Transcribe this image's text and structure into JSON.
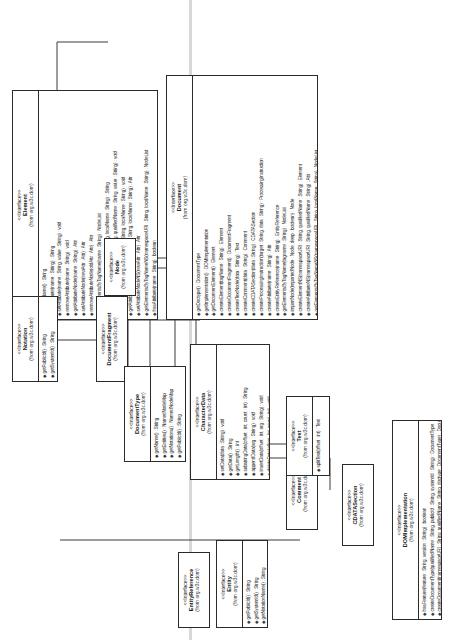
{
  "diagram": {
    "kind": "uml-class-diagram",
    "package": "(from org.w3c.dom)",
    "stereotype": "<<Interface>>",
    "rotation_degrees": -90,
    "relationship": "generalization"
  },
  "classes": {
    "attr": {
      "stereotype": "<<Interface>>",
      "name": "Attr",
      "package": "(from org.w3c.dom)",
      "operations": [
        "getName() : String",
        "getSpecified() : boolean",
        "getValue() : String",
        "setValue(value : String) : void",
        "getOwnerElement() : Element"
      ]
    },
    "processing_instruction": {
      "stereotype": "<<Interface>>",
      "name": "ProcessingInstruction",
      "package": "(from org.w3c.dom)",
      "operations": [
        "getTarget() : String",
        "setData(data : String) : void",
        "getData() : String"
      ]
    },
    "element": {
      "stereotype": "<<Interface>>",
      "name": "Element",
      "package": "(from org.w3c.dom)",
      "operations": [
        "getTagName() : String",
        "getAttribute(name : String) : String",
        "setAttribute(name : String, value : String) : void",
        "removeAttribute(name : String) : void",
        "getAttributeNode(name : String) : Attr",
        "setAttributeNode(newAttr : Attr) : Attr",
        "removeAttributeNode(oldAttr : Attr) : Attr",
        "getElementsByTagName(name : String) : NodeList",
        "getAttributeNS(namespaceURI : String, localName : String) : String",
        "setAttributeNS(namespaceURI : String, qualifiedName : String, value : String) : void",
        "removeAttributeNS(namespaceURI : String, localName : String) : void",
        "getAttributeNodeNS(namespaceURI : String, localName : String) : Attr",
        "setAttributeNodeNS(newAttr : Attr) : Attr",
        "getElementsByTagNameNS(namespaceURI : String, localName : String) : NodeList",
        "hasAttribute(name : String) : boolean",
        "hasAttributeNS(namespaceURI : String, localName : String) : boolean"
      ]
    },
    "document": {
      "stereotype": "<<Interface>>",
      "name": "Document",
      "package": "(from org.w3c.dom)",
      "operations": [
        "getDoctype() : DocumentType",
        "getImplementation() : DOMImplementation",
        "getDocumentElement() : Element",
        "createElement(tagName : String) : Element",
        "createDocumentFragment() : DocumentFragment",
        "createTextNode(data : String) : Text",
        "createComment(data : String) : Comment",
        "createCDATASection(data : String) : CDATASection",
        "createProcessingInstruction(target : String, data : String) : ProcessingInstruction",
        "createAttribute(name : String) : Attr",
        "createEntityReference(name : String) : EntityReference",
        "getElementsByTagName(tagname : String) : NodeList",
        "importNode(importedNode : Node, deep : boolean) : Node",
        "createElementNS(namespaceURI : String, qualifiedName : String) : Element",
        "createAttributeNS(namespaceURI : String, qualifiedName : String) : Attr",
        "getElementsByTagNameNS(namespaceURI : String, localName : String) : NodeList",
        "getElementById(elementId : String) : Element"
      ]
    },
    "notation": {
      "stereotype": "<<Interface>>",
      "name": "Notation",
      "package": "(from org.w3c.dom)",
      "operations": [
        "getPublicId() : String",
        "getSystemId() : String"
      ]
    },
    "document_fragment": {
      "stereotype": "<<Interface>>",
      "name": "DocumentFragment",
      "package": "(from org.w3c.dom)",
      "operations": []
    },
    "node": {
      "stereotype": "<<Interface>>",
      "name": "Node",
      "package": "(from org.w3c.dom)",
      "operations": []
    },
    "document_type": {
      "stereotype": "<<Interface>>",
      "name": "DocumentType",
      "package": "(from org.w3c.dom)",
      "operations": [
        "getName() : String",
        "getEntities() : NamedNodeMap",
        "getNotations() : NamedNodeMap",
        "getPublicId() : String",
        "getSystemId() : String",
        "getInternalSubset() : String"
      ]
    },
    "character_data": {
      "stereotype": "<<Interface>>",
      "name": "CharacterData",
      "package": "(from org.w3c.dom)",
      "operations": [
        "setData(data : String) : void",
        "getData() : String",
        "getLength() : int",
        "substringData(offset : int, count : int) : String",
        "appendData(arg : String) : void",
        "insertData(offset : int, arg : String) : void",
        "deleteData(offset : int, count : int) : void",
        "replaceData(offset : int, count : int, arg : String) : void"
      ]
    },
    "entity_reference": {
      "stereotype": "<<Interface>>",
      "name": "EntityReference",
      "package": "(from org.w3c.dom)",
      "operations": []
    },
    "entity": {
      "stereotype": "<<Interface>>",
      "name": "Entity",
      "package": "(from org.w3c.dom)",
      "operations": [
        "getPublicId() : String",
        "getSystemId() : String",
        "getNotationName() : String"
      ]
    },
    "comment": {
      "stereotype": "<<Interface>>",
      "name": "Comment",
      "package": "(from org.w3c.dom)",
      "operations": []
    },
    "text": {
      "stereotype": "<<Interface>>",
      "name": "Text",
      "package": "(from org.w3c.dom)",
      "operations": [
        "splitText(offset : int) : Text"
      ]
    },
    "cdata_section": {
      "stereotype": "<<Interface>>",
      "name": "CDATASection",
      "package": "(from org.w3c.dom)",
      "operations": []
    },
    "dom_implementation": {
      "stereotype": "<<Interface>>",
      "name": "DOMImplementation",
      "package": "(from org.w3c.dom)",
      "operations": [
        "hasFeature(feature : String, version : String) : boolean",
        "createDocumentType(qualifiedName : String, publicId : String, systemId : String) : DocumentType",
        "createDocument(namespaceURI : String, qualifiedName : String, doctype : DocumentType) : Document"
      ]
    }
  },
  "colors": {
    "line": "#3a3a3a",
    "border": "#2b2b2b",
    "background": "#ffffff",
    "band": "#d8d8d8"
  }
}
